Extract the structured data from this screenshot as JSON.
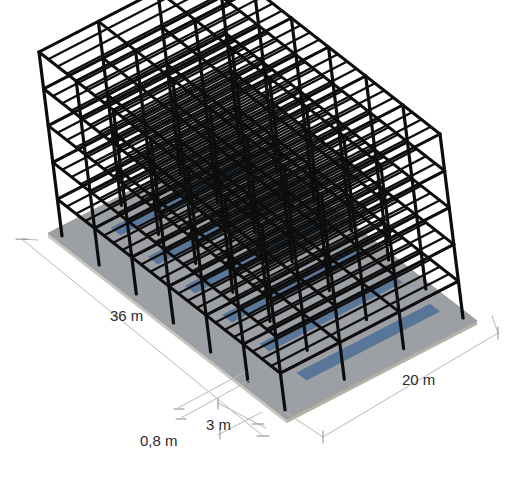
{
  "colors": {
    "frame": "#0d0d0d",
    "slab": "#9c9fa3",
    "slab_edge": "#c9c6bd",
    "bay_highlight": "#4d6f96",
    "dim_line": "#b8b8b8",
    "text": "#2a2a2a"
  },
  "structure": {
    "storeys": 5,
    "bays_long": 6,
    "bays_short": 3,
    "joists_per_bay_long": 3
  },
  "dimensions": {
    "length": "36 m",
    "width": "20 m",
    "bay": "3 m",
    "offset": "0,8 m"
  }
}
